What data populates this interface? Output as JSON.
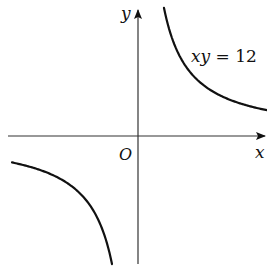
{
  "figure": {
    "x_axis_label": "x",
    "y_axis_label": "y",
    "origin_label": "O",
    "equation": {
      "lhs": "xy",
      "eq": " = ",
      "rhs": "12"
    },
    "curve_color": "#111111",
    "axis_color": "#333333",
    "curve_constant_px": 3330,
    "origin_px": [
      138,
      136
    ],
    "branches": [
      {
        "name": "first-quadrant",
        "x_start_px": 164,
        "x_end_px": 267
      },
      {
        "name": "third-quadrant",
        "x_start_px": 12,
        "x_end_px": 112
      }
    ]
  }
}
